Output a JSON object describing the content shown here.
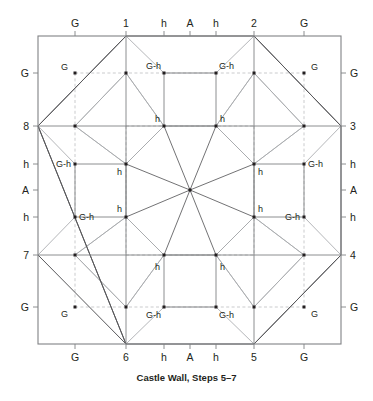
{
  "figure": {
    "title": "Castle Wall, Steps 5–7",
    "colors": {
      "stroke_dark": "#58585b",
      "stroke_mid": "#808285",
      "stroke_light": "#a7a9ac",
      "dashed": "#bcbec0",
      "dot": "#231f20",
      "text": "#231f20",
      "background": "#ffffff"
    },
    "geometry": {
      "square": {
        "left": 38,
        "top": 36,
        "right": 341,
        "bottom": 344
      },
      "center": {
        "x": 190,
        "y": 190
      },
      "grid_x": [
        38,
        75,
        126,
        164,
        190,
        216,
        254,
        304,
        341
      ],
      "grid_y": [
        36,
        73,
        126,
        164,
        190,
        217,
        255,
        307,
        344
      ]
    }
  },
  "axes": {
    "top": [
      {
        "label": "G",
        "x": 75
      },
      {
        "label": "1",
        "x": 126
      },
      {
        "label": "h",
        "x": 164
      },
      {
        "label": "A",
        "x": 190
      },
      {
        "label": "h",
        "x": 216
      },
      {
        "label": "2",
        "x": 254
      },
      {
        "label": "G",
        "x": 304
      }
    ],
    "bottom": [
      {
        "label": "G",
        "x": 75
      },
      {
        "label": "6",
        "x": 126
      },
      {
        "label": "h",
        "x": 164
      },
      {
        "label": "A",
        "x": 190
      },
      {
        "label": "h",
        "x": 216
      },
      {
        "label": "5",
        "x": 254
      },
      {
        "label": "G",
        "x": 304
      }
    ],
    "left": [
      {
        "label": "G",
        "y": 73
      },
      {
        "label": "8",
        "y": 126
      },
      {
        "label": "h",
        "y": 164
      },
      {
        "label": "A",
        "y": 190
      },
      {
        "label": "h",
        "y": 217
      },
      {
        "label": "7",
        "y": 255
      },
      {
        "label": "G",
        "y": 307
      }
    ],
    "right": [
      {
        "label": "G",
        "y": 73
      },
      {
        "label": "3",
        "y": 126
      },
      {
        "label": "h",
        "y": 164
      },
      {
        "label": "A",
        "y": 190
      },
      {
        "label": "h",
        "y": 217
      },
      {
        "label": "4",
        "y": 255
      },
      {
        "label": "G",
        "y": 307
      }
    ]
  },
  "node_labels": [
    {
      "text": "G",
      "x": 68,
      "y": 70,
      "anchor": "end"
    },
    {
      "text": "G",
      "x": 311,
      "y": 70,
      "anchor": "start"
    },
    {
      "text": "G",
      "x": 68,
      "y": 317,
      "anchor": "end"
    },
    {
      "text": "G",
      "x": 311,
      "y": 317,
      "anchor": "start"
    },
    {
      "text": "G-h",
      "x": 161,
      "y": 69,
      "anchor": "end"
    },
    {
      "text": "G-h",
      "x": 219,
      "y": 69,
      "anchor": "start"
    },
    {
      "text": "G-h",
      "x": 161,
      "y": 318,
      "anchor": "end"
    },
    {
      "text": "G-h",
      "x": 219,
      "y": 318,
      "anchor": "start"
    },
    {
      "text": "G-h",
      "x": 71,
      "y": 167,
      "anchor": "end"
    },
    {
      "text": "G-h",
      "x": 79,
      "y": 220,
      "anchor": "start"
    },
    {
      "text": "G-h",
      "x": 308,
      "y": 167,
      "anchor": "start"
    },
    {
      "text": "G-h",
      "x": 300,
      "y": 220,
      "anchor": "end"
    },
    {
      "text": "h",
      "x": 160,
      "y": 122,
      "anchor": "end"
    },
    {
      "text": "h",
      "x": 220,
      "y": 122,
      "anchor": "start"
    },
    {
      "text": "h",
      "x": 160,
      "y": 270,
      "anchor": "end"
    },
    {
      "text": "h",
      "x": 220,
      "y": 270,
      "anchor": "start"
    },
    {
      "text": "h",
      "x": 122,
      "y": 175,
      "anchor": "end"
    },
    {
      "text": "h",
      "x": 122,
      "y": 212,
      "anchor": "end"
    },
    {
      "text": "h",
      "x": 258,
      "y": 175,
      "anchor": "start"
    },
    {
      "text": "h",
      "x": 258,
      "y": 212,
      "anchor": "start"
    }
  ],
  "chart_data": {
    "type": "diagram",
    "title": "Castle Wall, Steps 5–7",
    "boundary_points": [
      "1",
      "2",
      "3",
      "4",
      "5",
      "6",
      "7",
      "8"
    ],
    "marker_labels": [
      "G",
      "G-h",
      "h",
      "A"
    ]
  }
}
